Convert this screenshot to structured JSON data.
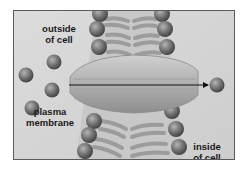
{
  "labels": {
    "outside": [
      "outside",
      "of cell"
    ],
    "plasma": [
      "plasma",
      "membrane"
    ],
    "inside": [
      "inside",
      "of cell"
    ]
  },
  "colors": {
    "background": "#d6d6d6",
    "frame_border": "#5a5a5a",
    "sphere_light": "#a8a8a8",
    "sphere_dark": "#4a4a4a",
    "tail": "#9a9a9a",
    "protein_light": "#c4c4c4",
    "protein_dark": "#8c8c8c",
    "arrow": "#111111"
  },
  "diagram": {
    "free_molecules_outside": 5,
    "free_molecules_inside": 1,
    "arrow_direction": "outside-to-inside"
  }
}
